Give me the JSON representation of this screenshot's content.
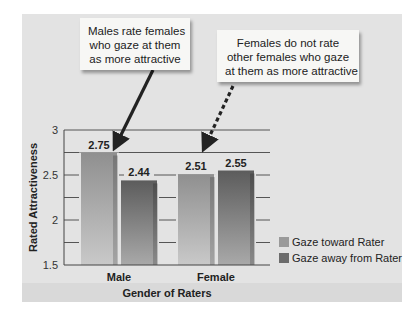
{
  "callouts": {
    "left": [
      "Males rate females",
      "who gaze at them",
      "as more attractive"
    ],
    "right": [
      "Females do not rate",
      "other females who gaze",
      "at them as more attractive"
    ]
  },
  "colors": {
    "gaze_toward": "#9a9a9a",
    "gaze_away": "#6c6c6c",
    "panel": "#e3e3e3",
    "callout_bg": "#f7f7f5",
    "arrow": "#222222"
  },
  "chart_data": {
    "type": "bar",
    "title": "",
    "xlabel": "Gender of Raters",
    "ylabel": "Rated Attractiveness",
    "categories": [
      "Male",
      "Female"
    ],
    "series": [
      {
        "name": "Gaze toward Rater",
        "values": [
          2.75,
          2.51
        ],
        "labels": [
          "2.75",
          "2.51"
        ]
      },
      {
        "name": "Gaze away from Rater",
        "values": [
          2.44,
          2.55
        ],
        "labels": [
          "2.44",
          "2.55"
        ]
      }
    ],
    "ylim": [
      1.5,
      3
    ],
    "yticks": [
      1.5,
      2,
      2.5,
      3
    ],
    "ytick_labels": [
      "1.5",
      "2",
      "2.5",
      "3"
    ],
    "minor_gridlines": [
      1.75,
      2.25,
      2.75
    ],
    "grid": true,
    "legend": {
      "placement": "bottom-right",
      "entries": [
        "Gaze toward Rater",
        "Gaze away from Rater"
      ]
    },
    "annotations": [
      {
        "text": "Males rate females who gaze at them as more attractive",
        "points_to": "Male / Gaze toward Rater",
        "arrow_style": "solid"
      },
      {
        "text": "Females do not rate other females who gaze at them as more attractive",
        "points_to": "Female bars",
        "arrow_style": "dashed"
      }
    ]
  }
}
